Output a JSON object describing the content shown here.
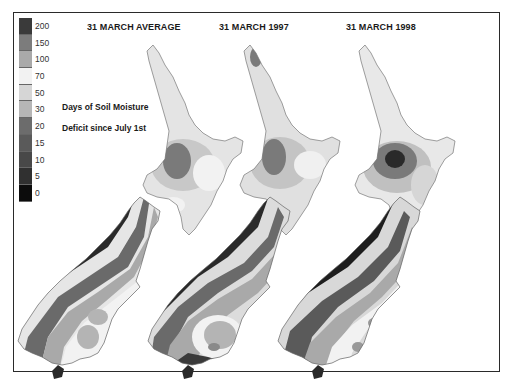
{
  "figure": {
    "titles": [
      "31 MARCH AVERAGE",
      "31 MARCH 1997",
      "31 MARCH 1998"
    ],
    "caption_line1": "Days of Soil Moisture",
    "caption_line2": "Deficit since July 1st"
  },
  "legend": {
    "items": [
      {
        "label": "200",
        "color": "#3a3a3a"
      },
      {
        "label": "150",
        "color": "#7c7c7c"
      },
      {
        "label": "100",
        "color": "#a9a9a9"
      },
      {
        "label": "70",
        "color": "#f2f2f2"
      },
      {
        "label": "50",
        "color": "#d6d6d6"
      },
      {
        "label": "30",
        "color": "#b6b6b6"
      },
      {
        "label": "20",
        "color": "#6c6c6c"
      },
      {
        "label": "15",
        "color": "#5a5a5a"
      },
      {
        "label": "10",
        "color": "#484848"
      },
      {
        "label": "5",
        "color": "#303030"
      },
      {
        "label": "0",
        "color": "#0c0c0c"
      }
    ]
  },
  "maps": [
    {
      "title": "31 MARCH AVERAGE"
    },
    {
      "title": "31 MARCH 1997"
    },
    {
      "title": "31 MARCH 1998"
    }
  ]
}
